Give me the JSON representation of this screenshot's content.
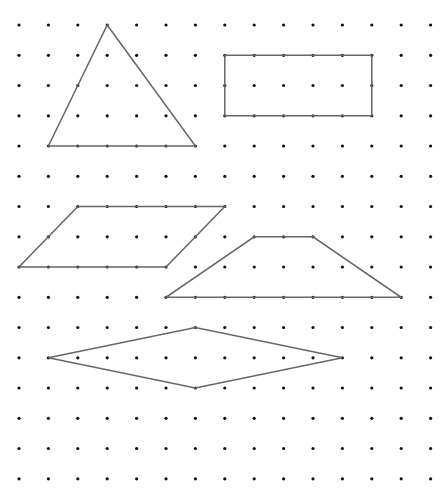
{
  "diagram": {
    "grid": {
      "columns": 15,
      "rows": 16,
      "origin_x": 19,
      "origin_y": 25,
      "spacing_x": 29.4,
      "spacing_y": 30.25,
      "dot_radius": 1.6,
      "dot_color": "#111111"
    },
    "line_color": "#666666",
    "shapes": [
      {
        "name": "triangle",
        "label": "Triangle",
        "points": [
          [
            3,
            0
          ],
          [
            6,
            4
          ],
          [
            1,
            4
          ]
        ]
      },
      {
        "name": "rectangle",
        "label": "Rectangle",
        "points": [
          [
            7,
            1
          ],
          [
            12,
            1
          ],
          [
            12,
            3
          ],
          [
            7,
            3
          ]
        ]
      },
      {
        "name": "parallelogram",
        "label": "Parallelogram",
        "points": [
          [
            2,
            6
          ],
          [
            7,
            6
          ],
          [
            5,
            8
          ],
          [
            0,
            8
          ]
        ]
      },
      {
        "name": "trapezoid",
        "label": "Trapezoid",
        "points": [
          [
            8,
            7
          ],
          [
            10,
            7
          ],
          [
            13,
            9
          ],
          [
            5,
            9
          ]
        ]
      },
      {
        "name": "rhombus",
        "label": "Rhombus",
        "points": [
          [
            1,
            11
          ],
          [
            6,
            10
          ],
          [
            11,
            11
          ],
          [
            6,
            12
          ]
        ]
      }
    ]
  }
}
